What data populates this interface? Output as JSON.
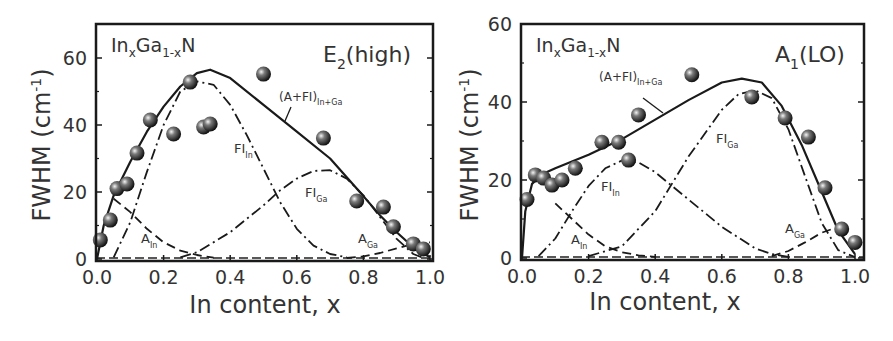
{
  "figure": {
    "panels": [
      {
        "id": "left",
        "material_label": {
          "base": "In",
          "sub1": "x",
          "mid": "Ga",
          "sub2": "1-x",
          "end": "N"
        },
        "mode_label": {
          "base": "E",
          "sub": "2",
          "rest": "(high)"
        },
        "ylabel": "FWHM (cm",
        "ylabel_sup": "-1",
        "ylabel_end": ")",
        "xlabel": "In content, x",
        "xticks": [
          "0.0",
          "0.2",
          "0.4",
          "0.6",
          "0.8",
          "1.0"
        ],
        "yticks": [
          "0",
          "20",
          "40",
          "60"
        ],
        "annotations": {
          "total": {
            "base": "(A+FI)",
            "sub": "In+Ga"
          },
          "fi_in": {
            "base": "FI",
            "sub": "In"
          },
          "fi_ga": {
            "base": "FI",
            "sub": "Ga"
          },
          "a_in": {
            "base": "A",
            "sub": "In"
          },
          "a_ga": {
            "base": "A",
            "sub": "Ga"
          }
        }
      },
      {
        "id": "right",
        "material_label": {
          "base": "In",
          "sub1": "x",
          "mid": "Ga",
          "sub2": "1-x",
          "end": "N"
        },
        "mode_label": {
          "base": "A",
          "sub": "1",
          "rest": "(LO)"
        },
        "ylabel": "FWHM (cm",
        "ylabel_sup": "-1",
        "ylabel_end": ")",
        "xlabel": "In content, x",
        "xticks": [
          "0.0",
          "0.2",
          "0.4",
          "0.6",
          "0.8",
          "1.0"
        ],
        "yticks": [
          "0",
          "20",
          "40",
          "60"
        ],
        "annotations": {
          "total": {
            "base": "(A+FI)",
            "sub": "In+Ga"
          },
          "fi_in": {
            "base": "FI",
            "sub": "In"
          },
          "fi_ga": {
            "base": "FI",
            "sub": "Ga"
          },
          "a_in": {
            "base": "A",
            "sub": "In"
          },
          "a_ga": {
            "base": "A",
            "sub": "Ga"
          }
        }
      }
    ]
  },
  "chart_data": [
    {
      "type": "scatter",
      "title": "E2(high)",
      "subtitle": "InxGa1-xN",
      "xlabel": "In content, x",
      "ylabel": "FWHM (cm-1)",
      "xlim": [
        0.0,
        1.0
      ],
      "ylim": [
        0,
        70
      ],
      "xticks": [
        0.0,
        0.2,
        0.4,
        0.6,
        0.8,
        1.0
      ],
      "yticks": [
        0,
        20,
        40,
        60
      ],
      "grid": false,
      "legend": "inline annotations",
      "series": [
        {
          "name": "Experimental",
          "style": "sphere markers",
          "x": [
            0.01,
            0.04,
            0.06,
            0.09,
            0.12,
            0.16,
            0.23,
            0.28,
            0.32,
            0.34,
            0.5,
            0.68,
            0.78,
            0.86,
            0.89,
            0.95,
            0.98
          ],
          "y": [
            5.7,
            11.6,
            21.0,
            22.4,
            31.6,
            41.5,
            37.3,
            52.8,
            39.4,
            40.3,
            55.2,
            36.1,
            17.3,
            15.5,
            9.6,
            4.5,
            3.0
          ]
        },
        {
          "name": "(A+FI)In+Ga",
          "style": "solid line",
          "x": [
            0.0,
            0.02,
            0.05,
            0.1,
            0.15,
            0.2,
            0.25,
            0.3,
            0.34,
            0.4,
            0.5,
            0.6,
            0.7,
            0.78,
            0.85,
            0.9,
            0.95,
            1.0
          ],
          "y": [
            0,
            10,
            19,
            29,
            38,
            45.5,
            51.5,
            55.5,
            56.5,
            54,
            46,
            38,
            30,
            21,
            13,
            8,
            3.5,
            0.5
          ]
        },
        {
          "name": "FIIn",
          "style": "dash-dot line",
          "x": [
            0.05,
            0.1,
            0.15,
            0.2,
            0.25,
            0.3,
            0.35,
            0.4,
            0.45,
            0.5,
            0.55,
            0.6,
            0.65,
            0.7,
            0.75
          ],
          "y": [
            0.5,
            11,
            26,
            40,
            50,
            53,
            52,
            46,
            37,
            27,
            17,
            9,
            4,
            1.5,
            0.5
          ]
        },
        {
          "name": "FIGa",
          "style": "dash-dot line",
          "x": [
            0.25,
            0.3,
            0.4,
            0.5,
            0.55,
            0.6,
            0.65,
            0.7,
            0.75,
            0.8,
            0.85,
            0.9,
            0.95,
            0.98
          ],
          "y": [
            0.5,
            2,
            8,
            16,
            20.5,
            24,
            26.3,
            26.5,
            24,
            19,
            12.5,
            6,
            1.5,
            0.3
          ]
        },
        {
          "name": "AIn",
          "style": "dashed line",
          "x": [
            0.05,
            0.1,
            0.15,
            0.2,
            0.25,
            0.3,
            0.35
          ],
          "y": [
            18,
            14,
            9,
            5,
            2.5,
            1.2,
            0.4
          ]
        },
        {
          "name": "AGa",
          "style": "dashed line",
          "x": [
            0.75,
            0.8,
            0.85,
            0.9,
            0.95,
            1.0
          ],
          "y": [
            0.3,
            0.8,
            1.8,
            3.2,
            4.5,
            5
          ]
        }
      ]
    },
    {
      "type": "scatter",
      "title": "A1(LO)",
      "subtitle": "InxGa1-xN",
      "xlabel": "In content, x",
      "ylabel": "FWHM (cm-1)",
      "xlim": [
        0.0,
        1.0
      ],
      "ylim": [
        0,
        60
      ],
      "xticks": [
        0.0,
        0.2,
        0.4,
        0.6,
        0.8,
        1.0
      ],
      "yticks": [
        0,
        20,
        40,
        60
      ],
      "grid": false,
      "legend": "inline annotations",
      "series": [
        {
          "name": "Experimental",
          "style": "sphere markers",
          "x": [
            0.015,
            0.04,
            0.065,
            0.09,
            0.12,
            0.16,
            0.24,
            0.29,
            0.32,
            0.35,
            0.51,
            0.69,
            0.79,
            0.86,
            0.91,
            0.96,
            1.0
          ],
          "y": [
            15.0,
            21.3,
            20.5,
            18.7,
            20.0,
            23.0,
            29.7,
            29.7,
            25.1,
            36.7,
            47.0,
            41.3,
            35.9,
            31.0,
            18.0,
            7.4,
            4.0
          ]
        },
        {
          "name": "(A+FI)In+Ga",
          "style": "solid line",
          "x": [
            0.0,
            0.01,
            0.03,
            0.06,
            0.1,
            0.2,
            0.3,
            0.4,
            0.5,
            0.6,
            0.66,
            0.72,
            0.78,
            0.84,
            0.9,
            0.95,
            1.0
          ],
          "y": [
            0,
            12,
            19,
            21.5,
            23,
            26.5,
            30.5,
            35.5,
            40.5,
            45,
            46,
            45,
            39,
            29,
            17,
            7,
            1
          ]
        },
        {
          "name": "FIIn",
          "style": "dash-dot line",
          "x": [
            0.05,
            0.1,
            0.15,
            0.2,
            0.25,
            0.3,
            0.35,
            0.4,
            0.5,
            0.6,
            0.7,
            0.75,
            0.8
          ],
          "y": [
            0.5,
            5,
            12,
            18.5,
            23,
            25,
            24.5,
            22,
            15,
            8,
            2.5,
            1,
            0.3
          ]
        },
        {
          "name": "FIGa",
          "style": "dash-dot line",
          "x": [
            0.2,
            0.3,
            0.4,
            0.5,
            0.6,
            0.65,
            0.7,
            0.75,
            0.8,
            0.85,
            0.9,
            0.95,
            1.0
          ],
          "y": [
            0.5,
            3,
            12,
            26,
            38,
            42,
            43,
            41,
            33,
            21,
            9,
            2,
            0.2
          ]
        },
        {
          "name": "AIn",
          "style": "dashed line",
          "x": [
            0.1,
            0.15,
            0.2,
            0.25,
            0.3,
            0.35,
            0.4
          ],
          "y": [
            14,
            10,
            6,
            3,
            1.5,
            0.7,
            0.3
          ]
        },
        {
          "name": "AGa",
          "style": "dashed line",
          "x": [
            0.75,
            0.8,
            0.85,
            0.9,
            0.95
          ],
          "y": [
            0.5,
            1.8,
            4,
            6.5,
            8
          ]
        }
      ]
    }
  ]
}
